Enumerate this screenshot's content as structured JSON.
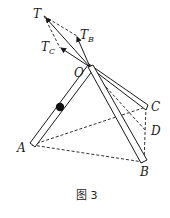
{
  "figure": {
    "caption": "图 3",
    "labels": {
      "T": "T",
      "TB_main": "T",
      "TB_sub": "B",
      "TC_main": "T",
      "TC_sub": "C",
      "O": "O",
      "A": "A",
      "B": "B",
      "C": "C",
      "D": "D"
    },
    "points": {
      "T": [
        44,
        16
      ],
      "TB_tip": [
        77,
        36
      ],
      "TC_tip": [
        60,
        48
      ],
      "O": [
        90,
        67
      ],
      "ball": [
        60,
        107
      ],
      "A": [
        32,
        145
      ],
      "B": [
        143,
        162
      ],
      "C": [
        146,
        107
      ],
      "D": [
        146,
        131
      ]
    },
    "elements": {
      "rods": [
        "OA",
        "OB",
        "OC"
      ],
      "force_vectors": [
        "OT",
        "OT_B",
        "OT_C"
      ],
      "dashed_lines": [
        "T-T_B",
        "T-T_C",
        "A-C",
        "A-B",
        "C-B",
        "O-D"
      ]
    },
    "colors": {
      "ink": "#1a1a1a",
      "background": "#ffffff"
    }
  }
}
